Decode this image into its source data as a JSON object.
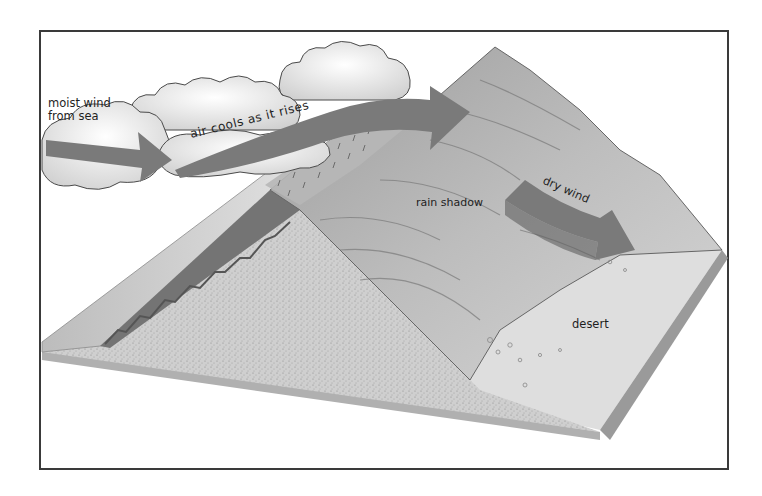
{
  "diagram": {
    "labels": {
      "moist_wind_line1": "moist wind",
      "moist_wind_line2": "from sea",
      "air_cools": "air cools as it rises",
      "rain_shadow": "rain shadow",
      "dry_wind": "dry wind",
      "desert": "desert"
    },
    "elements": [
      "clouds",
      "moist wind arrow",
      "rising air arrow",
      "mountain",
      "forested windward slope",
      "rain on windward slope",
      "dry wind arrow",
      "desert plain",
      "sea"
    ],
    "colors": {
      "arrow": "#7a7a7a",
      "frame": "#3a3a3a",
      "terrain": "#c8c8c8",
      "mountain": "#a8a8a8",
      "desert": "#dcdcdc",
      "forest": "#6f6f6f"
    }
  }
}
